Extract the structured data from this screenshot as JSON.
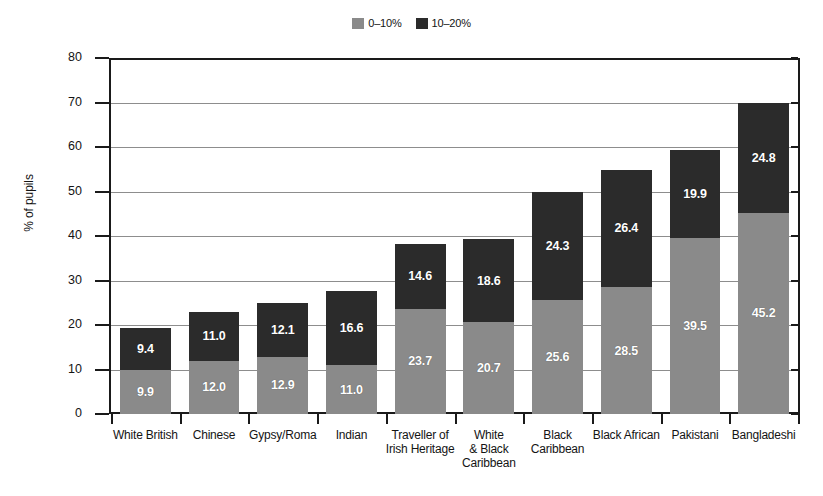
{
  "chart_data": {
    "type": "bar",
    "subtype": "stacked-bar",
    "title": "",
    "xlabel": "",
    "ylabel": "% of pupils",
    "ylim": [
      0,
      80
    ],
    "yticks": [
      0,
      10,
      20,
      30,
      40,
      50,
      60,
      70,
      80
    ],
    "grid": true,
    "legend_position": "top-center",
    "categories": [
      "White British",
      "Chinese",
      "Gypsy/Roma",
      "Indian",
      "Traveller of Irish Heritage",
      "White & Black Caribbean",
      "Black Caribbean",
      "Black African",
      "Pakistani",
      "Bangladeshi"
    ],
    "category_lines": [
      [
        "White British"
      ],
      [
        "Chinese"
      ],
      [
        "Gypsy/Roma"
      ],
      [
        "Indian"
      ],
      [
        "Traveller of",
        "Irish Heritage"
      ],
      [
        "White",
        "& Black",
        "Caribbean"
      ],
      [
        "Black",
        "Caribbean"
      ],
      [
        "Black African"
      ],
      [
        "Pakistani"
      ],
      [
        "Bangladeshi"
      ]
    ],
    "series": [
      {
        "name": "0–10%",
        "color": "#8a8a8a",
        "values": [
          9.9,
          12.0,
          12.9,
          11.0,
          23.7,
          20.7,
          25.6,
          28.5,
          39.5,
          45.2
        ]
      },
      {
        "name": "10–20%",
        "color": "#2b2b2b",
        "values": [
          9.4,
          11.0,
          12.1,
          16.6,
          14.6,
          18.6,
          24.3,
          26.4,
          19.9,
          24.8
        ]
      }
    ],
    "totals": [
      19.3,
      23.0,
      25.0,
      27.6,
      38.3,
      39.3,
      49.9,
      54.9,
      59.4,
      70.0
    ]
  },
  "legend": {
    "items": [
      {
        "label": "0–10%",
        "color": "#8a8a8a",
        "swatch_name": "legend-swatch-light"
      },
      {
        "label": "10–20%",
        "color": "#2b2b2b",
        "swatch_name": "legend-swatch-dark"
      }
    ]
  },
  "axes": {
    "y_title": "% of pupils",
    "y_tick_labels": [
      "80",
      "70",
      "60",
      "50",
      "40",
      "30",
      "20",
      "10",
      "0"
    ]
  },
  "colors": {
    "light_gray": "#8a8a8a",
    "dark_gray": "#2b2b2b",
    "axis": "#1a1a1a",
    "gridline": "#8d8d8d",
    "label_text": "#ffffff",
    "background": "#ffffff"
  }
}
